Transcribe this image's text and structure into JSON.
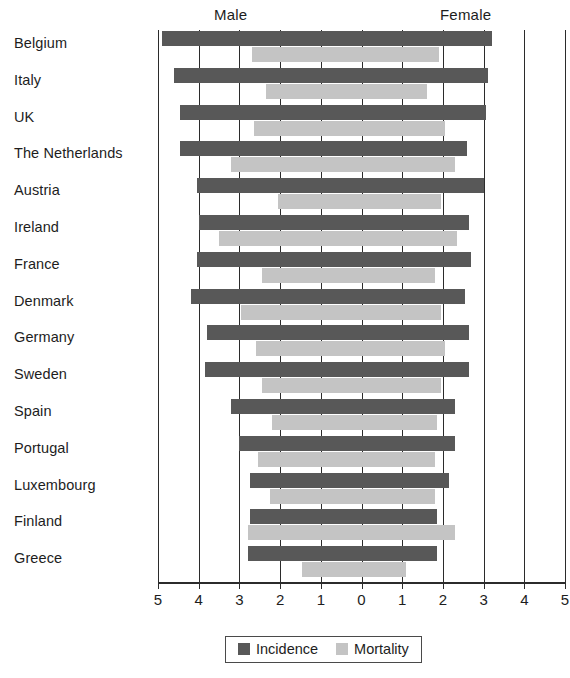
{
  "header": {
    "male_label": "Male",
    "female_label": "Female"
  },
  "legend": {
    "incidence_label": "Incidence",
    "mortality_label": "Mortality",
    "incidence_color": "#585858",
    "mortality_color": "#c4c4c4"
  },
  "chart_data": {
    "type": "bar",
    "orientation": "horizontal-diverging",
    "title": "",
    "subtitle": "",
    "xlabel": "",
    "ylabel": "",
    "xlim": [
      -5,
      5
    ],
    "axis_tick_labels": [
      "5",
      "4",
      "3",
      "2",
      "1",
      "0",
      "1",
      "2",
      "3",
      "4",
      "5"
    ],
    "axis_tick_values": [
      -5,
      -4,
      -3,
      -2,
      -1,
      0,
      1,
      2,
      3,
      4,
      5
    ],
    "grid": true,
    "grid_side_labels": [
      "Male",
      "Female"
    ],
    "legend_position": "bottom",
    "legend_entries": [
      "Incidence",
      "Mortality"
    ],
    "categories": [
      "Belgium",
      "Italy",
      "UK",
      "The Netherlands",
      "Austria",
      "Ireland",
      "France",
      "Denmark",
      "Germany",
      "Sweden",
      "Spain",
      "Portugal",
      "Luxembourg",
      "Finland",
      "Greece"
    ],
    "series": [
      {
        "name": "Incidence",
        "color": "#585858",
        "male": [
          4.9,
          4.6,
          4.45,
          4.45,
          4.05,
          4.0,
          4.05,
          4.2,
          3.8,
          3.85,
          3.2,
          3.0,
          2.75,
          2.75,
          2.8
        ],
        "female": [
          3.2,
          3.1,
          3.05,
          2.6,
          3.0,
          2.65,
          2.7,
          2.55,
          2.65,
          2.65,
          2.3,
          2.3,
          2.15,
          1.85,
          1.85
        ]
      },
      {
        "name": "Mortality",
        "color": "#c4c4c4",
        "male": [
          2.7,
          2.35,
          2.65,
          3.2,
          2.05,
          3.5,
          2.45,
          2.95,
          2.6,
          2.45,
          2.2,
          2.55,
          2.25,
          2.8,
          1.45
        ],
        "female": [
          1.9,
          1.6,
          2.05,
          2.3,
          1.95,
          2.35,
          1.8,
          1.95,
          2.05,
          1.95,
          1.85,
          1.8,
          1.8,
          2.3,
          1.1
        ]
      }
    ]
  }
}
